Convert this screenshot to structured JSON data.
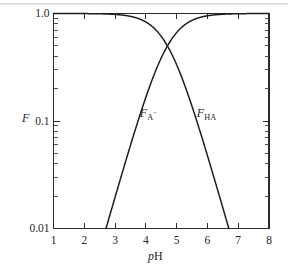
{
  "figure": {
    "name": "acid-base-fraction-vs-ph-plot",
    "background_color": "#ffffff",
    "line_color": "#1d1d1d",
    "axis_color": "#2b2b2b"
  },
  "axes": {
    "y_label": "F",
    "x_label_italic": "p",
    "x_label_roman": "H",
    "x_label_full": "pH",
    "y_tick_labels": [
      "1.0",
      "0.1",
      "0.01"
    ],
    "y_tick_values": [
      1.0,
      0.1,
      0.01
    ],
    "x_tick_labels": [
      "1",
      "2",
      "3",
      "4",
      "5",
      "6",
      "7",
      "8"
    ],
    "x_tick_values": [
      1,
      2,
      3,
      4,
      5,
      6,
      7,
      8
    ]
  },
  "annotations": [
    {
      "name": "curve-label-fa-minus",
      "base": "F",
      "sub": "A",
      "sup": "−",
      "text": "F_A−",
      "x_data": 4.0,
      "y_data": 0.115
    },
    {
      "name": "curve-label-fha",
      "base": "F",
      "sub": "HA",
      "sup": "",
      "text": "F_HA",
      "x_data": 5.85,
      "y_data": 0.115
    }
  ],
  "chart_data": {
    "type": "line",
    "title": "",
    "xlabel": "pH",
    "ylabel": "F",
    "xlim": [
      1,
      8
    ],
    "ylim": [
      0.01,
      1.0
    ],
    "yscale": "log",
    "xscale": "linear",
    "grid": false,
    "legend": "inline-annotations",
    "pKa": 4.7,
    "x": [
      1.0,
      1.5,
      2.0,
      2.5,
      2.75,
      3.0,
      3.25,
      3.5,
      3.75,
      4.0,
      4.25,
      4.5,
      4.7,
      5.0,
      5.25,
      5.5,
      5.75,
      6.0,
      6.25,
      6.5,
      6.75,
      7.0,
      7.5,
      8.0
    ],
    "series": [
      {
        "name": "F_HA",
        "label": "F_HA",
        "formula": "1/(1+10^(pH-pKa))",
        "values": [
          0.9998,
          0.9994,
          0.998,
          0.9937,
          0.9889,
          0.9804,
          0.9657,
          0.9405,
          0.8991,
          0.8343,
          0.7397,
          0.6131,
          0.5,
          0.3339,
          0.2194,
          0.1368,
          0.0818,
          0.0477,
          0.0274,
          0.0156,
          0.0089,
          0.005,
          0.0016,
          0.0005
        ]
      },
      {
        "name": "F_A-",
        "label": "F_A−",
        "formula": "10^(pH-pKa)/(1+10^(pH-pKa))",
        "values": [
          0.0002,
          0.0006,
          0.002,
          0.0063,
          0.0111,
          0.0196,
          0.0343,
          0.0595,
          0.1009,
          0.1657,
          0.2603,
          0.3869,
          0.5,
          0.6661,
          0.7806,
          0.8632,
          0.9182,
          0.9523,
          0.9726,
          0.9844,
          0.9911,
          0.995,
          0.9984,
          0.9995
        ]
      }
    ],
    "notes": {
      "crossing_point": {
        "x": 4.7,
        "y": 0.5
      },
      "fa_minus_reaches_floor_at_x": 2.78,
      "fha_reaches_floor_at_x": 6.72
    }
  }
}
